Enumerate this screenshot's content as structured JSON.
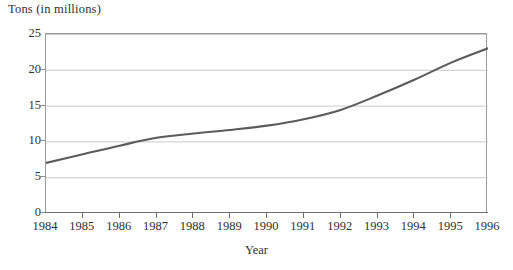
{
  "chart_data": {
    "type": "line",
    "title": "",
    "ylabel": "Tons (in millions)",
    "xlabel": "Year",
    "xlim": [
      1984,
      1996
    ],
    "ylim": [
      0,
      25
    ],
    "grid": true,
    "legend": "none",
    "y_ticks": [
      0,
      5,
      10,
      15,
      20,
      25
    ],
    "y_tick_labels": [
      "0",
      "5",
      "10",
      "15",
      "20",
      "25"
    ],
    "x_ticks": [
      1984,
      1985,
      1986,
      1987,
      1988,
      1989,
      1990,
      1991,
      1992,
      1993,
      1994,
      1995,
      1996
    ],
    "x_tick_labels": [
      "1984",
      "1985",
      "1986",
      "1987",
      "1988",
      "1989",
      "1990",
      "1991",
      "1992",
      "1993",
      "1994",
      "1995",
      "1996"
    ],
    "categories": [
      1984,
      1985,
      1986,
      1987,
      1988,
      1989,
      1990,
      1991,
      1992,
      1993,
      1994,
      1995,
      1996
    ],
    "series": [
      {
        "name": "Tons",
        "color": "#5b5b5b",
        "values": [
          7.0,
          8.2,
          9.4,
          10.5,
          11.1,
          11.6,
          12.2,
          13.1,
          14.4,
          16.4,
          18.6,
          21.0,
          23.0
        ]
      }
    ],
    "line_color": "#5b5b5b",
    "grid_color": "#c9c9c9",
    "axis_color": "#6f6f6f"
  }
}
